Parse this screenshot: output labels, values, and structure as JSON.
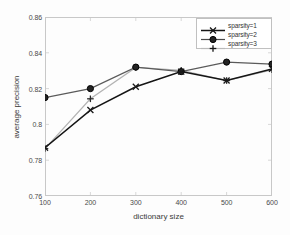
{
  "chart_data": {
    "type": "line",
    "title": "",
    "xlabel": "dictionary size",
    "ylabel": "average precision",
    "x": [
      100,
      200,
      300,
      400,
      500,
      600
    ],
    "xlim": [
      100,
      600
    ],
    "ylim": [
      0.76,
      0.86
    ],
    "xticks": [
      "100",
      "200",
      "300",
      "400",
      "500",
      "600"
    ],
    "yticks": [
      "0.76",
      "0.78",
      "0.8",
      "0.82",
      "0.84",
      "0.86"
    ],
    "ytick_values": [
      0.76,
      0.78,
      0.8,
      0.82,
      0.84,
      0.86
    ],
    "grid": false,
    "legend_position": "upper right",
    "series": [
      {
        "name": "sparsity=1",
        "marker": "x-marker",
        "color": "#1a1a1a",
        "values": [
          0.787,
          0.808,
          0.821,
          0.8295,
          0.8245,
          0.831
        ]
      },
      {
        "name": "sparsity=2",
        "marker": "circle-marker",
        "color": "#1a1a1a",
        "values": [
          0.815,
          0.82,
          0.832,
          0.8295,
          0.8348,
          0.8337
        ]
      },
      {
        "name": "sparsity=3",
        "marker": "plus-marker",
        "color": "#2a2a2a",
        "values": [
          0.7865,
          0.8143,
          0.8318,
          0.8302,
          0.8245,
          0.8305
        ]
      }
    ]
  },
  "legend": {
    "items": [
      {
        "label": "sparsity=1",
        "marker": "x-marker"
      },
      {
        "label": "sparsity=2",
        "marker": "circle-marker"
      },
      {
        "label": "sparsity=3",
        "marker": "plus-marker"
      }
    ]
  },
  "axes": {
    "xlabel": "dictionary size",
    "ylabel": "average precision"
  }
}
